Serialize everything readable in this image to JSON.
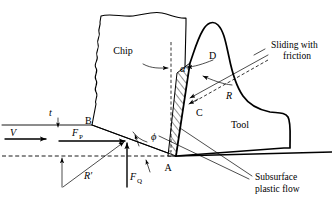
{
  "figure": {
    "type": "orthogonal-metal-cutting-diagram"
  },
  "regions": {
    "chip_label": "Chip",
    "tool_label": "Tool"
  },
  "points": {
    "a": "A",
    "b": "B",
    "c": "C",
    "d": "D"
  },
  "angles": {
    "rake_angle": "α",
    "shear_angle": "ϕ"
  },
  "forces": {
    "velocity": "V",
    "cutting_force_symbol": "F",
    "cutting_force_sub": "P",
    "thrust_force_symbol": "F",
    "thrust_force_sub": "Q",
    "resultant_tool": "R",
    "resultant_work": "R′",
    "depth_of_cut": "t"
  },
  "annotations": {
    "sliding_line1": "Sliding with",
    "sliding_line2": "friction",
    "subsurface_line1": "Subsurface",
    "subsurface_line2": "plastic flow"
  },
  "colors": {
    "stroke": "#000000",
    "background": "#ffffff"
  }
}
